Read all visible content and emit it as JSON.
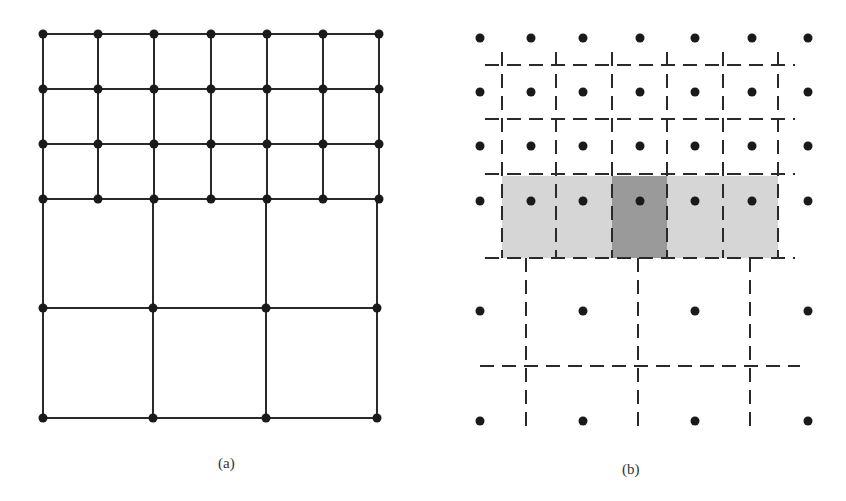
{
  "figure": {
    "panels": [
      {
        "id": "a",
        "label": "(a)",
        "description": "Locally refined mesh: fine grid on top, coarse grid below",
        "fine_grid": {
          "x": [
            43,
            98,
            154,
            211,
            267,
            323,
            379
          ],
          "y": [
            34,
            89,
            144,
            199
          ]
        },
        "coarse_grid": {
          "x": [
            43,
            153,
            266,
            377
          ],
          "y": [
            199,
            308,
            418
          ]
        }
      },
      {
        "id": "b",
        "label": "(b)",
        "description": "Cell-centered nodes with dashed control-volume boundaries; shaded stencil row",
        "fine_nodes": {
          "x": [
            480,
            531,
            583,
            640,
            695,
            752,
            808
          ],
          "y": [
            38,
            92,
            146,
            201
          ]
        },
        "coarse_nodes": {
          "x": [
            480,
            583,
            695,
            808
          ],
          "y": [
            311,
            421
          ]
        },
        "fine_dash_v_x": [
          502,
          556,
          612,
          667,
          723,
          778
        ],
        "fine_dash_h_y": [
          65,
          119,
          174
        ],
        "coarse_dash_v_x": [
          526,
          638,
          750
        ],
        "coarse_dash_h_y": [
          366
        ],
        "band": {
          "x0": 502,
          "x1": 778,
          "y0": 176,
          "y1": 258
        },
        "shaded_cells": [
          {
            "x0": 502,
            "x1": 556,
            "shade": "light"
          },
          {
            "x0": 556,
            "x1": 612,
            "shade": "light"
          },
          {
            "x0": 612,
            "x1": 667,
            "shade": "dark"
          },
          {
            "x0": 667,
            "x1": 778,
            "shade": "light"
          }
        ]
      }
    ],
    "colors": {
      "line": "#2a2a2a",
      "dot": "#1a1a1a",
      "shade_light": "#d6d6d6",
      "shade_dark": "#9a9a9a"
    }
  }
}
